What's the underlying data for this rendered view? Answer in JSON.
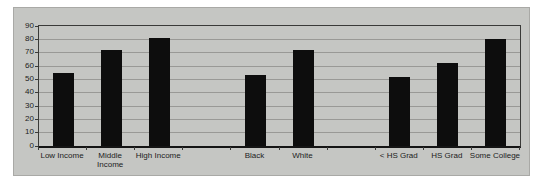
{
  "chart_data": {
    "type": "bar",
    "title": "",
    "categories": [
      "Low Income",
      "Middle\nIncome",
      "High Income",
      "Black",
      "White",
      "< HS Grad",
      "HS Grad",
      "Some College"
    ],
    "values": [
      55,
      72,
      81,
      53,
      72,
      52,
      62,
      80
    ],
    "slots": [
      0,
      1,
      2,
      4,
      5,
      7,
      8,
      9
    ],
    "num_slots": 10,
    "ylim": [
      0,
      90
    ],
    "yticks": [
      0,
      10,
      20,
      30,
      40,
      50,
      60,
      70,
      80,
      90
    ],
    "grid": true,
    "legend": "none",
    "colors": {
      "bar": "#0d0d0d",
      "chart_bg": "#c5c6c3",
      "chart_border": "#a9a9a6",
      "page_bg": "#ffffff",
      "gridline": "#999996",
      "plot_border": "#3a3a38",
      "axis_line": "#141414",
      "text": "#1c1c1c"
    }
  }
}
